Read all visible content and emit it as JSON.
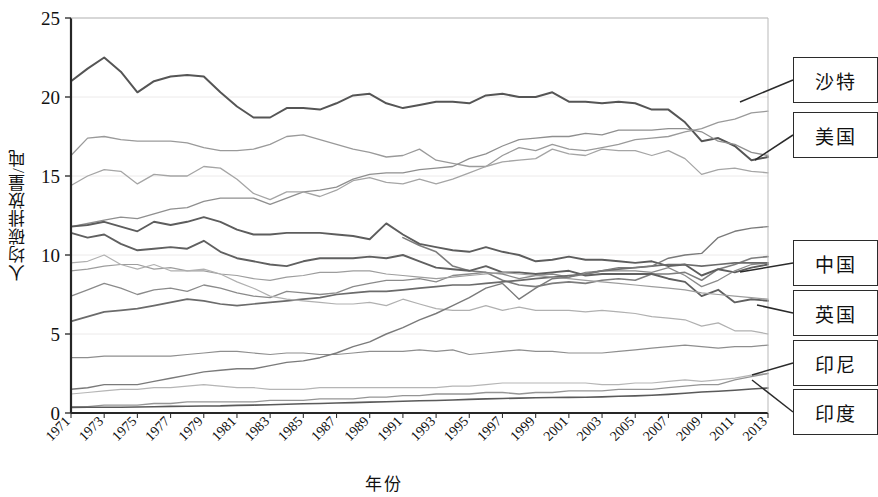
{
  "chart_data": {
    "type": "line",
    "title": "",
    "xlabel": "年份",
    "ylabel": "人均碳排放量/吨",
    "xlim": [
      1971,
      2013
    ],
    "ylim": [
      0,
      25
    ],
    "yticks": [
      0,
      5,
      10,
      15,
      20,
      25
    ],
    "xticks": [
      1971,
      1973,
      1975,
      1977,
      1979,
      1981,
      1983,
      1985,
      1987,
      1989,
      1991,
      1993,
      1995,
      1997,
      1999,
      2001,
      2003,
      2005,
      2007,
      2009,
      2011,
      2013
    ],
    "grid": true,
    "legend_position": "right-callouts",
    "x": [
      1971,
      1972,
      1973,
      1974,
      1975,
      1976,
      1977,
      1978,
      1979,
      1980,
      1981,
      1982,
      1983,
      1984,
      1985,
      1986,
      1987,
      1988,
      1989,
      1990,
      1991,
      1992,
      1993,
      1994,
      1995,
      1996,
      1997,
      1998,
      1999,
      2000,
      2001,
      2002,
      2003,
      2004,
      2005,
      2006,
      2007,
      2008,
      2009,
      2010,
      2011,
      2012,
      2013
    ],
    "series": [
      {
        "name": "美国",
        "color": "#555555",
        "width": 2.0,
        "values": [
          21.0,
          21.8,
          22.5,
          21.6,
          20.3,
          21.0,
          21.3,
          21.4,
          21.3,
          20.3,
          19.4,
          18.7,
          18.7,
          19.3,
          19.3,
          19.2,
          19.6,
          20.1,
          20.2,
          19.6,
          19.3,
          19.5,
          19.7,
          19.7,
          19.6,
          20.1,
          20.2,
          20.0,
          20.0,
          20.3,
          19.7,
          19.7,
          19.6,
          19.7,
          19.6,
          19.2,
          19.2,
          18.4,
          17.2,
          17.4,
          16.9,
          16.0,
          16.2
        ]
      },
      {
        "name": "沙特",
        "color": "#9a9a9a",
        "width": 1.3,
        "values": [
          16.3,
          17.4,
          17.5,
          17.3,
          17.2,
          17.2,
          17.2,
          17.1,
          16.8,
          16.6,
          16.6,
          16.7,
          17.0,
          17.5,
          17.6,
          17.3,
          17.0,
          16.7,
          16.5,
          16.2,
          16.3,
          16.7,
          16.0,
          15.8,
          15.6,
          15.6,
          16.3,
          16.8,
          16.6,
          17.0,
          16.7,
          16.6,
          16.8,
          17.0,
          17.3,
          17.4,
          17.5,
          17.8,
          18.0,
          18.4,
          18.6,
          19.0,
          19.1
        ]
      },
      {
        "name": "澳大利亚",
        "color": "#8f8f8f",
        "width": 1.3,
        "values": [
          11.8,
          12.0,
          12.2,
          12.4,
          12.3,
          12.6,
          12.9,
          13.0,
          13.4,
          13.6,
          13.6,
          13.6,
          13.2,
          13.6,
          14.0,
          14.1,
          14.3,
          14.8,
          15.1,
          15.2,
          15.2,
          15.4,
          15.5,
          15.6,
          16.1,
          16.4,
          16.9,
          17.3,
          17.4,
          17.5,
          17.5,
          17.7,
          17.6,
          17.9,
          17.9,
          17.9,
          18.0,
          18.0,
          17.8,
          17.2,
          17.0,
          16.5,
          16.3
        ]
      },
      {
        "name": "加拿大",
        "color": "#a5a5a5",
        "width": 1.3,
        "values": [
          14.4,
          15.0,
          15.4,
          15.3,
          14.5,
          15.1,
          15.0,
          15.0,
          15.6,
          15.5,
          14.8,
          13.9,
          13.5,
          14.0,
          14.0,
          13.7,
          14.1,
          14.7,
          14.9,
          14.6,
          14.5,
          14.8,
          14.5,
          14.8,
          15.2,
          15.6,
          15.9,
          16.0,
          16.1,
          16.7,
          16.4,
          16.3,
          16.7,
          16.6,
          16.6,
          16.3,
          16.6,
          16.1,
          15.1,
          15.4,
          15.5,
          15.3,
          15.2
        ]
      },
      {
        "name": "俄罗斯",
        "color": "#7d7d7d",
        "width": 1.6,
        "values": [
          null,
          null,
          null,
          null,
          null,
          null,
          null,
          null,
          null,
          null,
          null,
          null,
          null,
          null,
          null,
          null,
          null,
          null,
          null,
          null,
          11.1,
          10.6,
          10.2,
          9.3,
          9.0,
          8.9,
          8.4,
          8.1,
          8.0,
          8.2,
          8.3,
          8.2,
          8.4,
          8.5,
          8.4,
          8.8,
          8.8,
          8.9,
          8.4,
          9.1,
          9.4,
          9.8,
          9.9
        ]
      },
      {
        "name": "德国",
        "color": "#5d5d5d",
        "width": 1.9,
        "values": [
          11.8,
          11.9,
          12.1,
          11.8,
          11.5,
          12.1,
          11.9,
          12.1,
          12.4,
          12.1,
          11.6,
          11.3,
          11.3,
          11.4,
          11.4,
          11.4,
          11.3,
          11.2,
          11.0,
          12.0,
          11.3,
          10.7,
          10.5,
          10.3,
          10.2,
          10.5,
          10.2,
          10.0,
          9.6,
          9.7,
          9.9,
          9.7,
          9.7,
          9.6,
          9.5,
          9.6,
          9.3,
          9.4,
          8.7,
          9.1,
          8.9,
          9.2,
          9.4
        ]
      },
      {
        "name": "日本",
        "color": "#8a8a8a",
        "width": 1.3,
        "values": [
          7.4,
          7.8,
          8.2,
          7.9,
          7.5,
          7.8,
          7.9,
          7.7,
          8.1,
          7.9,
          7.6,
          7.4,
          7.3,
          7.7,
          7.6,
          7.5,
          7.6,
          8.0,
          8.2,
          8.4,
          8.4,
          8.5,
          8.3,
          8.7,
          8.8,
          8.9,
          8.8,
          8.5,
          8.7,
          8.8,
          8.6,
          8.9,
          9.0,
          9.0,
          9.0,
          8.9,
          9.2,
          8.7,
          8.0,
          8.4,
          9.0,
          9.4,
          9.5
        ]
      },
      {
        "name": "英国",
        "color": "#606060",
        "width": 1.9,
        "values": [
          11.4,
          11.1,
          11.3,
          10.7,
          10.3,
          10.4,
          10.5,
          10.4,
          10.9,
          10.2,
          9.8,
          9.6,
          9.4,
          9.3,
          9.6,
          9.8,
          9.8,
          9.8,
          9.9,
          9.8,
          10.0,
          9.6,
          9.2,
          9.1,
          9.0,
          9.3,
          8.9,
          8.9,
          8.8,
          8.9,
          9.0,
          8.7,
          8.8,
          8.8,
          8.8,
          8.8,
          8.5,
          8.3,
          7.4,
          7.8,
          7.0,
          7.2,
          7.1
        ]
      },
      {
        "name": "中国",
        "color": "#6b6b6b",
        "width": 1.7,
        "values": [
          5.8,
          6.1,
          6.4,
          6.5,
          6.6,
          6.8,
          7.0,
          7.2,
          7.1,
          6.9,
          6.8,
          6.9,
          7.0,
          7.1,
          7.2,
          7.3,
          7.5,
          7.6,
          7.7,
          7.7,
          7.8,
          7.9,
          8.0,
          8.1,
          8.1,
          8.2,
          8.3,
          8.4,
          8.5,
          8.6,
          8.7,
          8.8,
          9.0,
          9.1,
          9.2,
          9.3,
          9.4,
          9.4,
          9.3,
          9.4,
          9.5,
          9.5,
          9.5
        ]
      },
      {
        "name": "南非",
        "color": "#9d9d9d",
        "width": 1.2,
        "values": [
          9.0,
          9.1,
          9.3,
          9.4,
          9.4,
          9.1,
          9.2,
          9.0,
          9.0,
          8.8,
          8.7,
          8.5,
          8.4,
          8.6,
          8.7,
          8.9,
          8.9,
          9.0,
          9.0,
          8.8,
          8.7,
          8.6,
          8.5,
          8.6,
          8.7,
          8.8,
          8.9,
          8.8,
          8.7,
          8.6,
          8.5,
          8.4,
          8.3,
          8.2,
          8.1,
          8.0,
          7.9,
          7.8,
          7.6,
          7.5,
          7.4,
          7.3,
          7.2
        ]
      },
      {
        "name": "法国",
        "color": "#b0b0b0",
        "width": 1.2,
        "values": [
          9.5,
          9.6,
          10.0,
          9.4,
          9.1,
          9.4,
          9.0,
          9.0,
          9.1,
          8.8,
          8.3,
          7.9,
          7.4,
          7.2,
          7.1,
          7.0,
          6.9,
          6.9,
          7.0,
          6.8,
          7.2,
          6.9,
          6.6,
          6.5,
          6.5,
          6.8,
          6.5,
          6.7,
          6.5,
          6.5,
          6.5,
          6.4,
          6.5,
          6.4,
          6.3,
          6.1,
          6.0,
          5.9,
          5.5,
          5.7,
          5.2,
          5.2,
          5.0
        ]
      },
      {
        "name": "墨西哥",
        "color": "#8e8e8e",
        "width": 1.2,
        "values": [
          3.5,
          3.5,
          3.6,
          3.6,
          3.6,
          3.6,
          3.6,
          3.7,
          3.8,
          3.9,
          3.9,
          3.8,
          3.7,
          3.8,
          3.8,
          3.7,
          3.7,
          3.8,
          3.9,
          3.9,
          3.9,
          4.0,
          3.9,
          4.0,
          3.7,
          3.8,
          3.9,
          4.0,
          3.9,
          3.9,
          3.8,
          3.8,
          3.8,
          3.9,
          4.0,
          4.1,
          4.2,
          4.3,
          4.2,
          4.1,
          4.2,
          4.2,
          4.3
        ]
      },
      {
        "name": "韩国",
        "color": "#7a7a7a",
        "width": 1.4,
        "values": [
          1.5,
          1.6,
          1.8,
          1.8,
          1.8,
          2.0,
          2.2,
          2.4,
          2.6,
          2.7,
          2.8,
          2.8,
          3.0,
          3.2,
          3.3,
          3.5,
          3.8,
          4.2,
          4.5,
          5.0,
          5.4,
          5.9,
          6.3,
          6.8,
          7.3,
          7.9,
          8.2,
          7.2,
          7.9,
          8.5,
          8.6,
          8.8,
          9.0,
          9.2,
          9.2,
          9.3,
          9.8,
          10.0,
          10.1,
          11.1,
          11.5,
          11.7,
          11.8
        ]
      },
      {
        "name": "巴西",
        "color": "#b5b5b5",
        "width": 1.2,
        "values": [
          1.2,
          1.3,
          1.4,
          1.5,
          1.5,
          1.6,
          1.6,
          1.7,
          1.8,
          1.7,
          1.6,
          1.6,
          1.5,
          1.5,
          1.5,
          1.6,
          1.6,
          1.6,
          1.6,
          1.6,
          1.6,
          1.6,
          1.6,
          1.7,
          1.7,
          1.8,
          1.9,
          1.9,
          1.9,
          1.9,
          1.9,
          1.9,
          1.8,
          1.8,
          1.9,
          1.9,
          2.0,
          2.1,
          2.0,
          2.1,
          2.2,
          2.4,
          2.5
        ]
      },
      {
        "name": "印尼",
        "color": "#959595",
        "width": 1.3,
        "values": [
          0.4,
          0.4,
          0.5,
          0.5,
          0.5,
          0.6,
          0.6,
          0.7,
          0.7,
          0.7,
          0.7,
          0.7,
          0.8,
          0.8,
          0.8,
          0.9,
          0.9,
          0.9,
          1.0,
          1.0,
          1.1,
          1.1,
          1.2,
          1.2,
          1.2,
          1.3,
          1.3,
          1.2,
          1.3,
          1.3,
          1.4,
          1.4,
          1.4,
          1.5,
          1.5,
          1.5,
          1.6,
          1.7,
          1.8,
          1.8,
          2.1,
          2.3,
          2.5
        ]
      },
      {
        "name": "印度",
        "color": "#5a5a5a",
        "width": 1.6,
        "values": [
          0.35,
          0.36,
          0.37,
          0.37,
          0.38,
          0.4,
          0.42,
          0.43,
          0.44,
          0.45,
          0.48,
          0.5,
          0.52,
          0.55,
          0.58,
          0.6,
          0.63,
          0.66,
          0.69,
          0.71,
          0.74,
          0.77,
          0.79,
          0.82,
          0.86,
          0.89,
          0.92,
          0.94,
          0.97,
          0.98,
          0.99,
          1.0,
          1.02,
          1.06,
          1.08,
          1.12,
          1.18,
          1.25,
          1.33,
          1.38,
          1.44,
          1.52,
          1.58
        ]
      }
    ]
  },
  "callouts": [
    {
      "label": "沙特",
      "box_top": 57,
      "box_left": 793,
      "anchor_x": 740,
      "anchor_y": 102
    },
    {
      "label": "美国",
      "box_top": 112,
      "box_left": 793,
      "anchor_x": 755,
      "anchor_y": 160
    },
    {
      "label": "中国",
      "box_top": 240,
      "box_left": 793,
      "anchor_x": 740,
      "anchor_y": 272
    },
    {
      "label": "英国",
      "box_top": 290,
      "box_left": 793,
      "anchor_x": 757,
      "anchor_y": 305
    },
    {
      "label": "印尼",
      "box_top": 340,
      "box_left": 793,
      "anchor_x": 752,
      "anchor_y": 375
    },
    {
      "label": "印度",
      "box_top": 389,
      "box_left": 793,
      "anchor_x": 752,
      "anchor_y": 380
    }
  ]
}
